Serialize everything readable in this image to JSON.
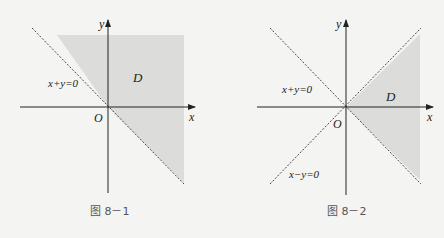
{
  "figures": [
    {
      "id": "fig1",
      "caption": "图 8－1",
      "region_label": "D",
      "line_label": "x+y=0",
      "origin_label": "O",
      "x_axis_label": "x",
      "y_axis_label": "y",
      "shading": "region above line x+y=0 (to the right/top), bounded box"
    },
    {
      "id": "fig2",
      "caption": "图 8－2",
      "region_label": "D",
      "line1_label": "x+y=0",
      "line2_label": "x−y=0",
      "origin_label": "O",
      "x_axis_label": "x",
      "y_axis_label": "y",
      "shading": "wedge between y=x and y=−x for x>0"
    }
  ],
  "colors": {
    "shade": "#dcdcda",
    "axis": "#222222",
    "dashed": "#333333",
    "background": "#f4f4f2"
  }
}
